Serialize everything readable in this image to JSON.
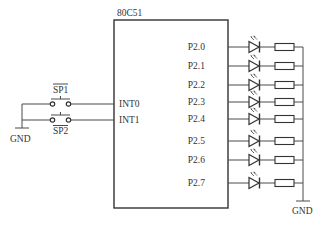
{
  "diagram": {
    "chip": {
      "label": "80C51"
    },
    "inputs": [
      {
        "switch_label": "SP1",
        "pin_label": "INT0",
        "y": 104,
        "label_position": "above"
      },
      {
        "switch_label": "SP2",
        "pin_label": "INT1",
        "y": 120,
        "label_position": "below"
      }
    ],
    "input_ground_label": "GND",
    "outputs": [
      {
        "pin_label": "P2.0",
        "y": 47
      },
      {
        "pin_label": "P2.1",
        "y": 66
      },
      {
        "pin_label": "P2.2",
        "y": 85
      },
      {
        "pin_label": "P2.3",
        "y": 102
      },
      {
        "pin_label": "P2.4",
        "y": 119
      },
      {
        "pin_label": "P2.5",
        "y": 141
      },
      {
        "pin_label": "P2.6",
        "y": 160
      },
      {
        "pin_label": "P2.7",
        "y": 183
      }
    ],
    "output_ground_label": "GND",
    "colors": {
      "line": "#4a4a4a",
      "text": "#333333",
      "background": "#ffffff"
    }
  }
}
